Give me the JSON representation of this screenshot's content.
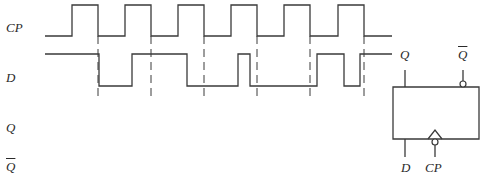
{
  "diagram": {
    "type": "timing-diagram-with-d-flipflop",
    "signal_labels": {
      "cp": "CP",
      "d": "D",
      "q": "Q",
      "qbar": "Q"
    },
    "flipflop_labels": {
      "q": "Q",
      "qbar": "Q",
      "d": "D",
      "cp": "CP"
    },
    "colors": {
      "line": "#3a3a3a",
      "text": "#2a2a2a",
      "background": "#ffffff"
    },
    "waveforms": {
      "cp": {
        "low_y": 36,
        "high_y": 5,
        "start_x": 45,
        "end_x": 392,
        "edges": [
          72,
          98,
          125,
          151,
          178,
          204,
          231,
          257,
          284,
          310,
          338,
          364
        ],
        "initial_level": "low"
      },
      "d": {
        "low_y": 86,
        "high_y": 54,
        "start_x": 45,
        "end_x": 392,
        "edges": [
          99,
          132,
          187,
          238,
          250,
          317,
          344,
          360
        ],
        "initial_level": "high"
      }
    },
    "dashed_markers": {
      "x": [
        98,
        151,
        204,
        257,
        310,
        364
      ],
      "y_top": 36,
      "y_bottom": 100
    },
    "flipflop": {
      "box": {
        "x": 393,
        "y": 87,
        "w": 86,
        "h": 52
      },
      "q_pin_x": 405,
      "qbar_pin_x": 463,
      "d_pin_x": 405,
      "cp_pin_x": 435
    }
  }
}
